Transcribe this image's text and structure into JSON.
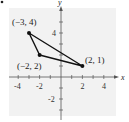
{
  "figure": {
    "bullet": true,
    "colors": {
      "background_panel": "#f0f0f0",
      "axes": "#555555",
      "triangle": "#111111",
      "text": "#222222"
    },
    "axes": {
      "x_label": "x",
      "y_label": "y",
      "x_ticks": [
        -4,
        -3,
        -2,
        -1,
        1,
        2,
        3,
        4
      ],
      "x_tick_labels": [
        "-4",
        "-2",
        "2",
        "4"
      ],
      "y_ticks": [
        -3,
        -2,
        -1,
        1,
        2,
        3,
        4,
        5
      ],
      "y_tick_labels": [
        "4",
        "-2"
      ]
    },
    "triangle": {
      "vertices": [
        {
          "x": -3,
          "y": 4,
          "label": "(−3, 4)"
        },
        {
          "x": -2,
          "y": 2,
          "label": "(−2, 2)"
        },
        {
          "x": 2,
          "y": 1,
          "label": "(2, 1)"
        }
      ]
    }
  }
}
